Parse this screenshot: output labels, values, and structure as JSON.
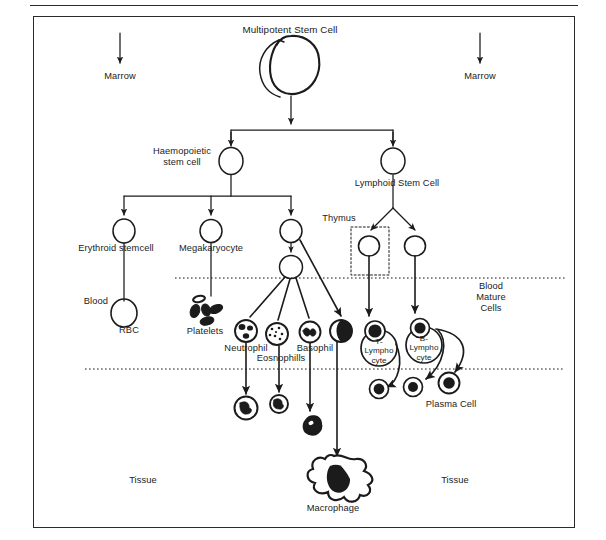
{
  "figure": {
    "type": "biological-flow-diagram",
    "background": "#ffffff",
    "ink": "#1b1b1b"
  },
  "regions": {
    "marrow_left": "Marrow",
    "marrow_right": "Marrow",
    "blood_mature_cells": "Blood\nMature\nCells",
    "tissue_left": "Tissue",
    "tissue_right": "Tissue",
    "thymus": "Thymus",
    "blood_rbc": "Blood"
  },
  "nodes": [
    {
      "id": "multipotent",
      "label": "Multipotent Stem Cell",
      "x": 290,
      "y": 60,
      "glyph": "blob-cell"
    },
    {
      "id": "haemopoietic",
      "label": "Haemopoietic\nstem cell",
      "x": 231,
      "y": 161,
      "glyph": "open-circle"
    },
    {
      "id": "lymphoid",
      "label": "Lymphoid Stem Cell",
      "x": 393,
      "y": 161,
      "glyph": "open-circle"
    },
    {
      "id": "erythroid",
      "label": "Erythroid stemcell",
      "x": 124,
      "y": 231,
      "glyph": "open-circle"
    },
    {
      "id": "megakaryocyte",
      "label": "Megakaryocyte",
      "x": 211,
      "y": 231,
      "glyph": "open-circle"
    },
    {
      "id": "myeloid",
      "label": "",
      "x": 291,
      "y": 231,
      "glyph": "open-circle"
    },
    {
      "id": "granuloprogenitor",
      "label": "",
      "x": 291,
      "y": 267,
      "glyph": "open-circle"
    },
    {
      "id": "rbc",
      "label": "RBC",
      "x": 124,
      "y": 313,
      "glyph": "open-circle-large"
    },
    {
      "id": "platelets",
      "label": "Platelets",
      "x": 205,
      "y": 312,
      "glyph": "platelet-cluster"
    },
    {
      "id": "neutrophil",
      "label": "Neutrophil",
      "x": 246,
      "y": 331,
      "glyph": "granulocyte-lobed"
    },
    {
      "id": "eosinophil",
      "label": "Eosnophills",
      "x": 277,
      "y": 334,
      "glyph": "granulocyte-dotted"
    },
    {
      "id": "basophil",
      "label": "Basophil",
      "x": 310,
      "y": 332,
      "glyph": "granulocyte-basophil"
    },
    {
      "id": "monocyte",
      "label": "",
      "x": 341,
      "y": 331,
      "glyph": "half-filled-circle"
    },
    {
      "id": "tlymphocyte",
      "label": "T-\nLympho\ncyte",
      "x": 378,
      "y": 338,
      "glyph": "lymphocyte-dark"
    },
    {
      "id": "blymphocyte",
      "label": "B-\nLympho\ncyte",
      "x": 424,
      "y": 335,
      "glyph": "lymphocyte-dark"
    },
    {
      "id": "tissue-neutrophil",
      "label": "",
      "x": 246,
      "y": 408,
      "glyph": "granulocyte-lobed"
    },
    {
      "id": "tissue-eosinophil",
      "label": "",
      "x": 279,
      "y": 404,
      "glyph": "granulocyte-lobed-small"
    },
    {
      "id": "tissue-basophil",
      "label": "",
      "x": 313,
      "y": 425,
      "glyph": "dark-blob-cell"
    },
    {
      "id": "macrophage",
      "label": "Macrophage",
      "x": 333,
      "y": 480,
      "glyph": "amoeboid-macrophage"
    },
    {
      "id": "t-effector",
      "label": "",
      "x": 379,
      "y": 389,
      "glyph": "small-dark-cell"
    },
    {
      "id": "b-memory",
      "label": "",
      "x": 413,
      "y": 387,
      "glyph": "small-dark-cell"
    },
    {
      "id": "plasma",
      "label": "Plasma Cell",
      "x": 449,
      "y": 383,
      "glyph": "small-dark-cell"
    }
  ],
  "labels": {
    "multipotent_stem_cell": "Multipotent Stem Cell",
    "haemopoietic_stem_cell": "Haemopoietic\nstem cell",
    "lymphoid_stem_cell": "Lymphoid Stem Cell",
    "erythroid_stemcell": "Erythroid stemcell",
    "megakaryocyte": "Megakaryocyte",
    "rbc": "RBC",
    "platelets": "Platelets",
    "neutrophil": "Neutrophil",
    "eosinophil": "Eosnophills",
    "basophil": "Basophil",
    "t_lymphocyte": "T-\nLympho\ncyte",
    "b_lymphocyte": "B-\nLympho\ncyte",
    "plasma_cell": "Plasma Cell",
    "macrophage": "Macrophage"
  },
  "boundaries": {
    "blood_line_y": 278,
    "tissue_line_y": 369,
    "style": "dotted"
  }
}
